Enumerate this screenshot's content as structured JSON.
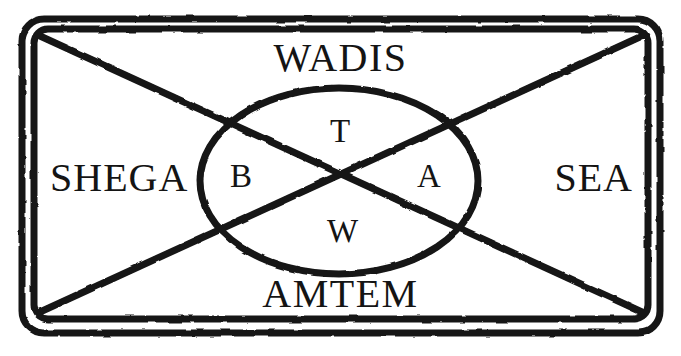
{
  "diagram": {
    "type": "schematic",
    "background_color": "#ffffff",
    "ink_color": "#141414",
    "frame": {
      "name": "double-rounded-rectangle",
      "outer": {
        "x": 22,
        "y": 19,
        "width": 638,
        "height": 314,
        "corner_radius": 22,
        "stroke_width": 7
      },
      "inner": {
        "x": 34,
        "y": 29,
        "width": 614,
        "height": 290,
        "corner_radius": 14,
        "stroke_width": 7
      }
    },
    "diagonals": {
      "name": "x-cross",
      "stroke_width": 7,
      "crossing_point": {
        "x": 347,
        "y": 180
      },
      "lines": [
        {
          "from": {
            "x": 40,
            "y": 36
          },
          "to": {
            "x": 642,
            "y": 312
          }
        },
        {
          "from": {
            "x": 642,
            "y": 36
          },
          "to": {
            "x": 40,
            "y": 312
          }
        }
      ]
    },
    "ellipse": {
      "name": "central-ellipse",
      "center": {
        "x": 339,
        "y": 181
      },
      "radius_x": 139,
      "radius_y": 93,
      "stroke_width": 7
    },
    "outer_labels": [
      {
        "key": "top",
        "text": "WADIS",
        "position": "top"
      },
      {
        "key": "left",
        "text": "SHEGA",
        "position": "left"
      },
      {
        "key": "right",
        "text": "SEA",
        "position": "right"
      },
      {
        "key": "bottom",
        "text": "AMTEM",
        "position": "bottom"
      }
    ],
    "inner_labels": [
      {
        "key": "top",
        "text": "T",
        "position": "top"
      },
      {
        "key": "left",
        "text": "B",
        "position": "left"
      },
      {
        "key": "right",
        "text": "A",
        "position": "right"
      },
      {
        "key": "bottom",
        "text": "W",
        "position": "bottom"
      }
    ]
  }
}
